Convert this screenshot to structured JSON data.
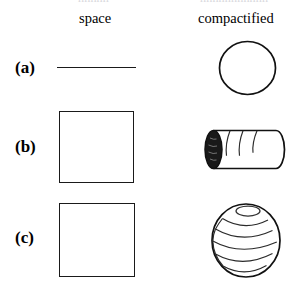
{
  "figure": {
    "top_cut_text_left": "hhhhh",
    "top_cut_text_right": "hhhhhhhhhhh",
    "columns": {
      "left_header": "space",
      "right_header": "compactified"
    },
    "rows": [
      {
        "label": "(a)",
        "space_shape": "horizontal-line",
        "space_shape_name": "line",
        "compactified_shape": "circle",
        "compactified_shape_name": "circle"
      },
      {
        "label": "(b)",
        "space_shape": "square",
        "space_shape_name": "square",
        "compactified_shape": "cylinder",
        "compactified_shape_name": "cylinder"
      },
      {
        "label": "(c)",
        "space_shape": "square",
        "space_shape_name": "square",
        "compactified_shape": "sphere",
        "compactified_shape_name": "sphere"
      }
    ],
    "colors": {
      "ink": "#111111",
      "line": "#1a1a1a",
      "background": "#ffffff",
      "cylinder_cap_fill": "#191919",
      "wrap_curve": "#2b2b2b"
    }
  }
}
